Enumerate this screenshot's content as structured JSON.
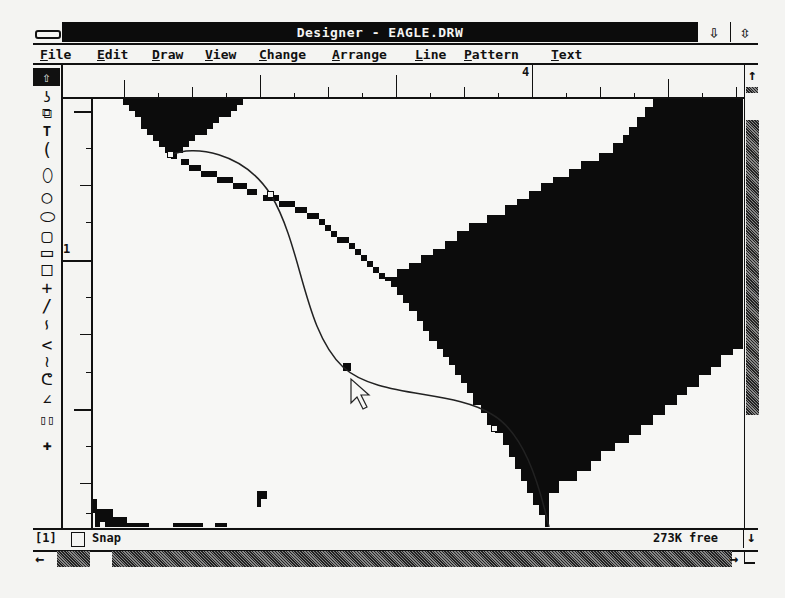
{
  "window": {
    "title": "Designer - EAGLE.DRW",
    "minimize_icon": "down-arrow-icon",
    "maximize_icon": "up-down-arrow-icon"
  },
  "menubar": {
    "items": [
      {
        "label": "File",
        "x": 40
      },
      {
        "label": "Edit",
        "x": 97
      },
      {
        "label": "Draw",
        "x": 152
      },
      {
        "label": "View",
        "x": 205
      },
      {
        "label": "Change",
        "x": 259
      },
      {
        "label": "Arrange",
        "x": 332
      },
      {
        "label": "Line",
        "x": 415
      },
      {
        "label": "Pattern",
        "x": 464
      },
      {
        "label": "Text",
        "x": 551
      }
    ]
  },
  "toolbox": {
    "tools": [
      {
        "name": "pointer",
        "glyph": "⇧"
      },
      {
        "name": "connector",
        "glyph": "ʖ"
      },
      {
        "name": "group",
        "glyph": "⧉"
      },
      {
        "name": "text",
        "glyph": "T"
      },
      {
        "name": "arc",
        "glyph": "("
      },
      {
        "name": "ellipse",
        "glyph": "⬯"
      },
      {
        "name": "circle",
        "glyph": "○"
      },
      {
        "name": "rounded-rect",
        "glyph": "⬭"
      },
      {
        "name": "rounded-square",
        "glyph": "▢"
      },
      {
        "name": "rectangle",
        "glyph": "▭"
      },
      {
        "name": "square",
        "glyph": "□"
      },
      {
        "name": "cross",
        "glyph": "+"
      },
      {
        "name": "line",
        "glyph": "/"
      },
      {
        "name": "curve",
        "glyph": "∽"
      },
      {
        "name": "polyline",
        "glyph": "<"
      },
      {
        "name": "bezier",
        "glyph": "≀"
      },
      {
        "name": "freehand",
        "glyph": "ᕦ"
      },
      {
        "name": "polygon",
        "glyph": "∠"
      },
      {
        "name": "double-box",
        "glyph": "▯▯"
      },
      {
        "name": "zoom",
        "glyph": "✚"
      }
    ]
  },
  "rulers": {
    "top_label": "4",
    "left_label": "1"
  },
  "status": {
    "page": "[1]",
    "snap_label": "Snap",
    "snap_checked": false,
    "memory": "273K free"
  },
  "scrollbars": {
    "up_icon": "↑",
    "down_icon": "↓",
    "left_icon": "←",
    "right_icon": "→"
  },
  "colors": {
    "ink": "#111111",
    "paper": "#f4f4f2"
  }
}
